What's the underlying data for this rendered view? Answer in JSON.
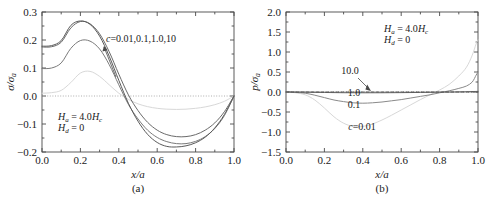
{
  "figure": {
    "panels": [
      {
        "caption": "(a)",
        "xlabel": "x/a",
        "ylabel_num": "σ",
        "ylabel_den": "σ",
        "ylabel_den_sub": "a",
        "annotation_line1_a": "H",
        "annotation_line1_a_sub": "a",
        "annotation_line1_eq": " = 4.0",
        "annotation_line1_h": "H",
        "annotation_line1_h_sub": "c",
        "annotation_line2_a": "H",
        "annotation_line2_a_sub": "d",
        "annotation_line2_eq": " = 0",
        "curve_label": "c",
        "curve_label_values": "=0.01,0.1,1.0,10",
        "xticks": [
          "0.0",
          "0.2",
          "0.4",
          "0.6",
          "0.8",
          "1.0"
        ],
        "yticks": [
          "0.3",
          "0.2",
          "0.1",
          "0.0",
          "−0.1",
          "−0.2"
        ]
      },
      {
        "caption": "(b)",
        "xlabel": "x/a",
        "ylabel_num": "p",
        "ylabel_den": "σ",
        "ylabel_den_sub": "a",
        "annotation_line1_a": "H",
        "annotation_line1_a_sub": "a",
        "annotation_line1_eq": " = 4.0",
        "annotation_line1_h": "H",
        "annotation_line1_h_sub": "c",
        "annotation_line2_a": "H",
        "annotation_line2_a_sub": "d",
        "annotation_line2_eq": " = 0",
        "inline_labels": [
          "10.0",
          "1.0",
          "0.1"
        ],
        "curve_label": "c",
        "curve_label_values": "=0.01",
        "xticks": [
          "0.0",
          "0.2",
          "0.4",
          "0.6",
          "0.8",
          "1.0"
        ],
        "yticks": [
          "2.0",
          "1.5",
          "1.0",
          "0.5",
          "0.0",
          "−0.5",
          "−1.0",
          "−1.5"
        ]
      }
    ]
  },
  "chart_data": [
    {
      "type": "line",
      "title": "(a)",
      "xlabel": "x/a",
      "ylabel": "sigma/sigma_a",
      "xlim": [
        0.0,
        1.0
      ],
      "ylim": [
        -0.2,
        0.3
      ],
      "grid": false,
      "legend": "inline annotation: c=0.01,0.1,1.0,10",
      "annotations": [
        "H_a = 4.0H_c",
        "H_d = 0",
        "c=0.01,0.1,1.0,10"
      ],
      "series": [
        {
          "name": "c=0.01",
          "color": "#d8d8d8",
          "x": [
            0.0,
            0.05,
            0.1,
            0.15,
            0.2,
            0.25,
            0.3,
            0.35,
            0.4,
            0.45,
            0.5,
            0.55,
            0.6,
            0.65,
            0.7,
            0.75,
            0.8,
            0.85,
            0.9,
            0.95,
            1.0
          ],
          "y": [
            0.01,
            0.012,
            0.02,
            0.048,
            0.082,
            0.088,
            0.07,
            0.04,
            0.01,
            -0.012,
            -0.028,
            -0.038,
            -0.044,
            -0.047,
            -0.048,
            -0.047,
            -0.044,
            -0.039,
            -0.031,
            -0.019,
            0.0
          ]
        },
        {
          "name": "c=0.1",
          "color": "#7a7a7a",
          "x": [
            0.0,
            0.05,
            0.1,
            0.15,
            0.2,
            0.25,
            0.3,
            0.35,
            0.4,
            0.45,
            0.5,
            0.55,
            0.6,
            0.65,
            0.7,
            0.75,
            0.8,
            0.85,
            0.9,
            0.95,
            1.0
          ],
          "y": [
            0.098,
            0.1,
            0.118,
            0.17,
            0.198,
            0.196,
            0.168,
            0.112,
            0.04,
            -0.03,
            -0.082,
            -0.122,
            -0.148,
            -0.163,
            -0.17,
            -0.17,
            -0.162,
            -0.145,
            -0.116,
            -0.07,
            0.0
          ]
        },
        {
          "name": "c=1.0",
          "color": "#6a6a6a",
          "x": [
            0.0,
            0.05,
            0.1,
            0.15,
            0.2,
            0.25,
            0.3,
            0.35,
            0.4,
            0.45,
            0.5,
            0.55,
            0.6,
            0.65,
            0.7,
            0.75,
            0.8,
            0.85,
            0.9,
            0.95,
            1.0
          ],
          "y": [
            0.175,
            0.176,
            0.192,
            0.243,
            0.266,
            0.258,
            0.222,
            0.158,
            0.078,
            0.004,
            -0.052,
            -0.094,
            -0.122,
            -0.138,
            -0.145,
            -0.145,
            -0.138,
            -0.122,
            -0.096,
            -0.056,
            0.0
          ]
        },
        {
          "name": "c=10",
          "color": "#5a5a5a",
          "x": [
            0.0,
            0.05,
            0.1,
            0.15,
            0.2,
            0.25,
            0.3,
            0.35,
            0.4,
            0.45,
            0.5,
            0.55,
            0.6,
            0.65,
            0.7,
            0.75,
            0.8,
            0.85,
            0.9,
            0.95,
            1.0
          ],
          "y": [
            0.178,
            0.18,
            0.198,
            0.252,
            0.268,
            0.256,
            0.214,
            0.142,
            0.056,
            -0.026,
            -0.09,
            -0.137,
            -0.166,
            -0.18,
            -0.182,
            -0.178,
            -0.167,
            -0.147,
            -0.114,
            -0.066,
            0.0
          ]
        }
      ]
    },
    {
      "type": "line",
      "title": "(b)",
      "xlabel": "x/a",
      "ylabel": "p/sigma_a",
      "xlim": [
        0.0,
        1.0
      ],
      "ylim": [
        -1.5,
        2.0
      ],
      "grid": false,
      "legend": "inline labels: 10.0, 1.0, 0.1, c=0.01",
      "annotations": [
        "H_a = 4.0H_c",
        "H_d = 0",
        "10.0",
        "1.0",
        "0.1",
        "c=0.01"
      ],
      "series": [
        {
          "name": "c=0.01",
          "color": "#d8d8d8",
          "x": [
            0.0,
            0.05,
            0.1,
            0.15,
            0.2,
            0.25,
            0.3,
            0.35,
            0.4,
            0.45,
            0.5,
            0.55,
            0.6,
            0.65,
            0.7,
            0.75,
            0.8,
            0.85,
            0.9,
            0.94,
            0.97,
            0.99,
            1.0
          ],
          "y": [
            0.0,
            -0.02,
            -0.07,
            -0.2,
            -0.4,
            -0.62,
            -0.78,
            -0.86,
            -0.86,
            -0.8,
            -0.7,
            -0.58,
            -0.45,
            -0.32,
            -0.19,
            -0.07,
            0.05,
            0.19,
            0.4,
            0.62,
            0.92,
            1.2,
            1.3
          ]
        },
        {
          "name": "c=0.1",
          "color": "#8a8a8a",
          "x": [
            0.0,
            0.05,
            0.1,
            0.15,
            0.2,
            0.25,
            0.3,
            0.35,
            0.4,
            0.45,
            0.5,
            0.55,
            0.6,
            0.65,
            0.7,
            0.75,
            0.8,
            0.85,
            0.9,
            0.94,
            0.97,
            0.99,
            1.0
          ],
          "y": [
            0.0,
            -0.01,
            -0.03,
            -0.08,
            -0.14,
            -0.2,
            -0.24,
            -0.27,
            -0.28,
            -0.27,
            -0.25,
            -0.22,
            -0.19,
            -0.15,
            -0.11,
            -0.07,
            -0.02,
            0.03,
            0.09,
            0.15,
            0.25,
            0.42,
            0.5
          ]
        },
        {
          "name": "c=1.0",
          "color": "#6a6a6a",
          "x": [
            0.0,
            0.1,
            0.2,
            0.3,
            0.4,
            0.5,
            0.6,
            0.7,
            0.8,
            0.9,
            0.95,
            1.0
          ],
          "y": [
            0.0,
            -0.005,
            -0.012,
            -0.018,
            -0.02,
            -0.019,
            -0.016,
            -0.011,
            -0.005,
            0.003,
            0.008,
            0.015
          ]
        },
        {
          "name": "c=10.0",
          "color": "#4a4a4a",
          "style": "dashed",
          "x": [
            0.0,
            0.2,
            0.4,
            0.6,
            0.8,
            1.0
          ],
          "y": [
            0.0,
            0.0,
            0.0,
            0.0,
            0.0,
            0.0
          ]
        }
      ]
    }
  ]
}
